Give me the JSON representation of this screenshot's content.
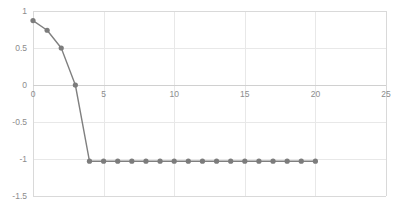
{
  "chart_data": {
    "type": "line",
    "title": "",
    "subtitle": "",
    "xlabel": "",
    "ylabel": "",
    "xlim": [
      0,
      25
    ],
    "ylim": [
      -1.5,
      1
    ],
    "xticks": [
      0,
      5,
      10,
      15,
      20,
      25
    ],
    "yticks": [
      1,
      0.5,
      0,
      -0.5,
      -1,
      -1.5
    ],
    "xtick_labels": [
      "0",
      "5",
      "10",
      "15",
      "20",
      "25"
    ],
    "ytick_labels": [
      "1",
      "0.5",
      "0",
      "-0.5",
      "-1",
      "-1.5"
    ],
    "grid": true,
    "grid_axes": "both",
    "legend": false,
    "legend_position": "none",
    "marker": "circle",
    "line_color": "#808080",
    "marker_color": "#7c7c7c",
    "grid_color": "#e8e8e8",
    "frame_color": "#d9d9d9",
    "background_color": "#ffffff",
    "series": [
      {
        "name": "series-1",
        "x": [
          0,
          1,
          2,
          3,
          4,
          5,
          6,
          7,
          8,
          9,
          10,
          11,
          12,
          13,
          14,
          15,
          16,
          17,
          18,
          19,
          20
        ],
        "values": [
          0.87,
          0.74,
          0.5,
          0.0,
          -1.03,
          -1.03,
          -1.03,
          -1.03,
          -1.03,
          -1.03,
          -1.03,
          -1.03,
          -1.03,
          -1.03,
          -1.03,
          -1.03,
          -1.03,
          -1.03,
          -1.03,
          -1.03,
          -1.03
        ]
      }
    ]
  },
  "axis": {
    "x_tick_labels": [
      "0",
      "5",
      "10",
      "15",
      "20",
      "25"
    ],
    "y_tick_labels": [
      "1",
      "0.5",
      "0",
      "-0.5",
      "-1",
      "-1.5"
    ]
  }
}
